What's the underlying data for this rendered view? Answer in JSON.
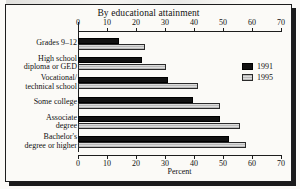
{
  "figure": {
    "title": "By educational attainment",
    "frame_color": "#1d1d1d",
    "background": "#fbfaf7"
  },
  "legend": {
    "position": "right-inside",
    "entries": [
      {
        "label": "1991",
        "swatch": "black-solid-swatch",
        "color": "#111111"
      },
      {
        "label": "1995",
        "swatch": "gray-hatched-swatch",
        "color": "#c8c8c8"
      }
    ]
  },
  "chart_data": {
    "type": "bar",
    "orientation": "horizontal",
    "title": "By educational attainment",
    "xlabel": "Percent",
    "ylabel": "",
    "xlim": [
      0,
      70
    ],
    "xticks": [
      0,
      10,
      20,
      30,
      40,
      50,
      60,
      70
    ],
    "xtick_labels": [
      "0",
      "10",
      "20",
      "30",
      "40",
      "50",
      "60",
      "70"
    ],
    "duplicate_axis_top": true,
    "grid": false,
    "categories": [
      "Grades 9–12",
      "High school diploma or GED",
      "Vocational/ technical school",
      "Some college",
      "Associate degree",
      "Bachelor's degree or higher"
    ],
    "category_lines": [
      [
        "Grades 9–12"
      ],
      [
        "High school",
        "diploma or GED"
      ],
      [
        "Vocational/",
        "technical school"
      ],
      [
        "Some college"
      ],
      [
        "Associate",
        "degree"
      ],
      [
        "Bachelor's",
        "degree or higher"
      ]
    ],
    "series": [
      {
        "name": "1991",
        "color": "#111111",
        "values": [
          14,
          22,
          31,
          39.5,
          49,
          52
        ]
      },
      {
        "name": "1995",
        "color": "#c8c8c8",
        "values": [
          23,
          30.5,
          41.5,
          49,
          56,
          58
        ]
      }
    ]
  }
}
